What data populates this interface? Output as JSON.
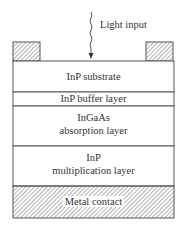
{
  "diagram": {
    "light_input_label": "Light input",
    "layers": [
      {
        "id": "substrate",
        "lines": [
          "InP substrate"
        ]
      },
      {
        "id": "buffer",
        "lines": [
          "InP buffer layer"
        ]
      },
      {
        "id": "absorption",
        "lines": [
          "InGaAs",
          "absorption layer"
        ]
      },
      {
        "id": "multiplication",
        "lines": [
          "InP",
          "multiplication layer"
        ]
      },
      {
        "id": "metal-contact",
        "lines": [
          "Metal contact"
        ]
      }
    ],
    "colors": {
      "outline": "#555555",
      "hatch": "#666666",
      "background": "#ffffff"
    }
  }
}
